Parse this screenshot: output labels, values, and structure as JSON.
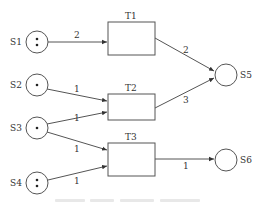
{
  "diagram": {
    "type": "petri-net",
    "places": [
      {
        "id": "S1",
        "label": "S1",
        "tokens": 2,
        "x": 37,
        "y": 42
      },
      {
        "id": "S2",
        "label": "S2",
        "tokens": 1,
        "x": 37,
        "y": 85
      },
      {
        "id": "S3",
        "label": "S3",
        "tokens": 1,
        "x": 37,
        "y": 128
      },
      {
        "id": "S4",
        "label": "S4",
        "tokens": 2,
        "x": 37,
        "y": 183
      },
      {
        "id": "S5",
        "label": "S5",
        "tokens": 0,
        "x": 226,
        "y": 75
      },
      {
        "id": "S6",
        "label": "S6",
        "tokens": 0,
        "x": 226,
        "y": 160
      }
    ],
    "transitions": [
      {
        "id": "T1",
        "label": "T1"
      },
      {
        "id": "T2",
        "label": "T2"
      },
      {
        "id": "T3",
        "label": "T3"
      }
    ],
    "arcs": [
      {
        "from": "S1",
        "to": "T1",
        "weight": "2"
      },
      {
        "from": "S2",
        "to": "T2",
        "weight": "1"
      },
      {
        "from": "S3",
        "to": "T2",
        "weight": "1"
      },
      {
        "from": "S3",
        "to": "T3",
        "weight": "1"
      },
      {
        "from": "S4",
        "to": "T3",
        "weight": "1"
      },
      {
        "from": "T1",
        "to": "S5",
        "weight": "2"
      },
      {
        "from": "T2",
        "to": "S5",
        "weight": "3"
      },
      {
        "from": "T3",
        "to": "S6",
        "weight": "1"
      }
    ],
    "caption": ""
  }
}
